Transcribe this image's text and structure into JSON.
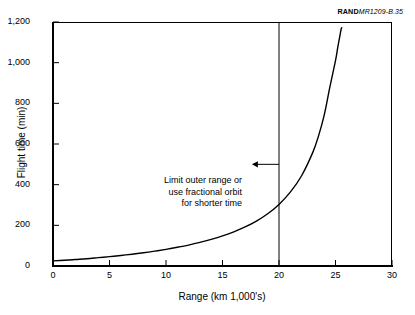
{
  "source_credit": {
    "bold": "RAND",
    "id": "MR1209-B.35"
  },
  "annotation": {
    "line1": "Limit outer range or",
    "line2": "use fractional orbit",
    "line3": "for shorter time"
  },
  "chart_data": {
    "type": "line",
    "title": "",
    "xlabel": "Range (km 1,000's)",
    "ylabel": "Flight time (min)",
    "xlim": [
      0,
      30
    ],
    "ylim": [
      0,
      1200
    ],
    "xticks": [
      "0",
      "5",
      "10",
      "15",
      "20",
      "25",
      "30"
    ],
    "xtick_values": [
      0,
      5,
      10,
      15,
      20,
      25,
      30
    ],
    "yticks": [
      "0",
      "200",
      "400",
      "600",
      "800",
      "1,000",
      "1,200"
    ],
    "ytick_values": [
      0,
      200,
      400,
      600,
      800,
      1000,
      1200
    ],
    "grid": false,
    "legend": null,
    "line_color": "#000000",
    "series": [
      {
        "name": "Flight time vs range",
        "x": [
          0,
          1,
          2,
          3,
          4,
          5,
          6,
          7,
          8,
          9,
          10,
          11,
          12,
          13,
          14,
          15,
          16,
          17,
          18,
          19,
          20,
          21,
          22,
          23,
          23.5,
          24,
          24.5,
          25,
          25.2,
          25.4,
          25.5,
          25.55
        ],
        "y": [
          25,
          28,
          32,
          36,
          41,
          46,
          52,
          58,
          65,
          73,
          82,
          92,
          103,
          116,
          131,
          148,
          168,
          192,
          221,
          257,
          303,
          363,
          444,
          560,
          640,
          742,
          880,
          1010,
          1075,
          1135,
          1165,
          1172
        ]
      }
    ],
    "annotations": [
      {
        "text_lines": [
          "Limit outer range or",
          "use fractional orbit",
          "for shorter time"
        ],
        "arrow_from_x": 20,
        "arrow_to_x": 17.6,
        "arrow_y": 500
      }
    ],
    "reference_lines": [
      {
        "orientation": "vertical",
        "x": 20,
        "color": "#000000"
      }
    ]
  }
}
